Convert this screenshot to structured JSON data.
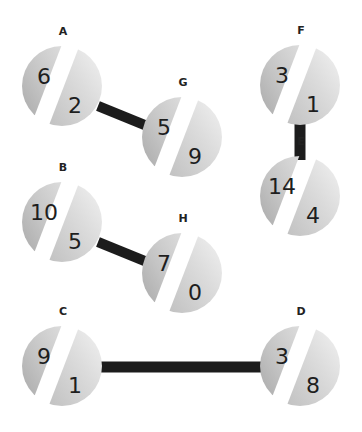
{
  "diagram": {
    "type": "graph",
    "colors": {
      "edge": "#1c1c1c",
      "node_dark": "#9a9a9a",
      "node_light": "#f2f2f2",
      "gap": "#ffffff",
      "text": "#1e1e1e"
    },
    "nodes": [
      {
        "id": "A",
        "label": "A",
        "cx": 62,
        "cy": 86,
        "left": "6",
        "right": "2"
      },
      {
        "id": "G",
        "label": "G",
        "cx": 182,
        "cy": 137,
        "left": "5",
        "right": "9"
      },
      {
        "id": "F",
        "label": "F",
        "cx": 300,
        "cy": 85,
        "left": "3",
        "right": "1"
      },
      {
        "id": "E",
        "label": "E",
        "cx": 300,
        "cy": 196,
        "left": "14",
        "right": "4"
      },
      {
        "id": "B",
        "label": "B",
        "cx": 62,
        "cy": 222,
        "left": "10",
        "right": "5"
      },
      {
        "id": "H",
        "label": "H",
        "cx": 182,
        "cy": 273,
        "left": "7",
        "right": "0"
      },
      {
        "id": "C",
        "label": "C",
        "cx": 62,
        "cy": 366,
        "left": "9",
        "right": "1"
      },
      {
        "id": "D",
        "label": "D",
        "cx": 300,
        "cy": 366,
        "left": "3",
        "right": "8"
      }
    ],
    "edges": [
      {
        "from": "A",
        "to": "G"
      },
      {
        "from": "F",
        "to": "E"
      },
      {
        "from": "B",
        "to": "H"
      },
      {
        "from": "C",
        "to": "D"
      }
    ]
  }
}
